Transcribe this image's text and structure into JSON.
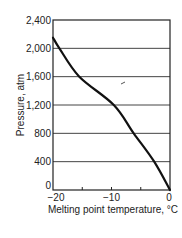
{
  "chart_data": {
    "type": "line",
    "title": "",
    "xlabel": "Melting point temperature, °C",
    "ylabel": "Pressure, atm",
    "xlim": [
      -20,
      0
    ],
    "ylim": [
      0,
      2400
    ],
    "x_ticks": [
      -20,
      -10,
      0
    ],
    "x_tick_labels": [
      "−20",
      "−10",
      "0"
    ],
    "x_minor_ticks": [
      -15,
      -5
    ],
    "y_ticks": [
      0,
      400,
      800,
      1200,
      1600,
      2000,
      2400
    ],
    "y_tick_labels": [
      "0",
      "400",
      "800",
      "1,200",
      "1,600",
      "2,000",
      "2,400"
    ],
    "grid": "horizontal",
    "legend": null,
    "series": [
      {
        "name": "Melting curve of ice",
        "x": [
          -20,
          -18.9,
          -15.5,
          -9.6,
          -6.2,
          -2.7,
          0
        ],
        "y": [
          2150,
          2000,
          1600,
          1200,
          800,
          400,
          0
        ]
      }
    ]
  }
}
